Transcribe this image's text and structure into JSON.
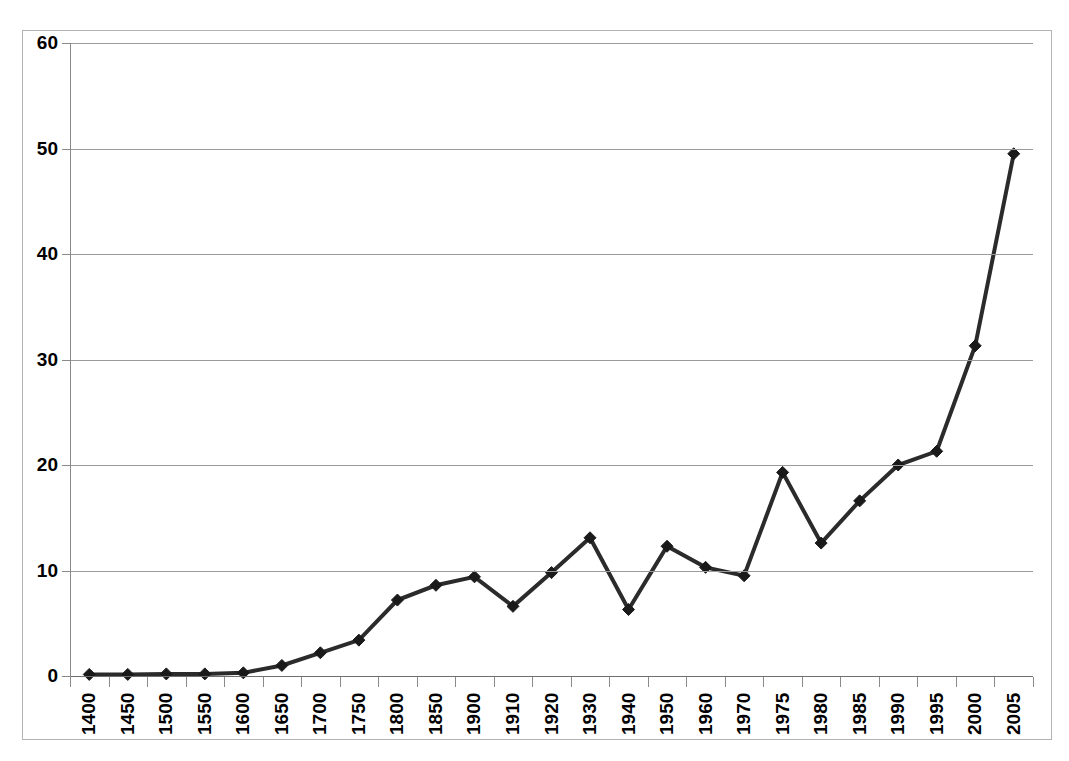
{
  "chart_data": {
    "type": "line",
    "title": "",
    "subtitle": "",
    "xlabel": "",
    "ylabel": "",
    "categories": [
      "1400",
      "1450",
      "1500",
      "1550",
      "1600",
      "1650",
      "1700",
      "1750",
      "1800",
      "1850",
      "1900",
      "1910",
      "1920",
      "1930",
      "1940",
      "1950",
      "1960",
      "1970",
      "1975",
      "1980",
      "1985",
      "1990",
      "1995",
      "2000",
      "2005"
    ],
    "values": [
      0.15,
      0.15,
      0.2,
      0.2,
      0.3,
      1.0,
      2.2,
      3.4,
      7.2,
      8.6,
      9.4,
      6.6,
      9.8,
      13.1,
      6.3,
      12.3,
      10.3,
      9.5,
      19.3,
      12.6,
      16.6,
      20.0,
      21.3,
      31.3,
      49.5
    ],
    "series": [
      {
        "name": "Series 1",
        "values": [
          0.15,
          0.15,
          0.2,
          0.2,
          0.3,
          1.0,
          2.2,
          3.4,
          7.2,
          8.6,
          9.4,
          6.6,
          9.8,
          13.1,
          6.3,
          12.3,
          10.3,
          9.5,
          19.3,
          12.6,
          16.6,
          20.0,
          21.3,
          31.3,
          49.5
        ]
      }
    ],
    "ylim": [
      0,
      60
    ],
    "yticks": [
      0,
      10,
      20,
      30,
      40,
      50,
      60
    ],
    "ytick_labels": [
      "0",
      "10",
      "20",
      "30",
      "40",
      "50",
      "60"
    ],
    "grid": true,
    "grid_axis": "y",
    "legend": false,
    "legend_position": "none",
    "marker": "diamond",
    "line_color": "#2b2b2b",
    "marker_color": "#1a1a1a",
    "grid_color": "#9a9a9a",
    "frame_color": "#b3b3b3",
    "background": "#ffffff"
  }
}
